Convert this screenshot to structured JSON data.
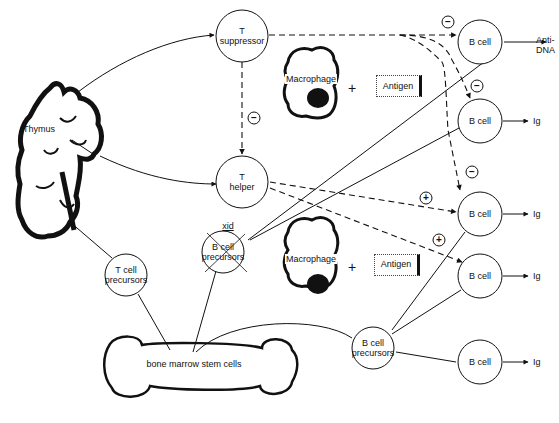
{
  "diagram": {
    "type": "immune-regulation-pathway",
    "organs": {
      "thymus": {
        "label": "Thymus"
      },
      "bone_marrow": {
        "label": "bone marrow stem cells"
      }
    },
    "nodes": {
      "t_suppressor": {
        "line1": "T",
        "line2": "suppressor"
      },
      "t_helper": {
        "line1": "T",
        "line2": "helper"
      },
      "t_cell_precursors": {
        "line1": "T cell",
        "line2": "precursors"
      },
      "xid_b_cell_precursors": {
        "tag": "xid",
        "line1": "B cell",
        "line2": "precursors",
        "crossed_out": true
      },
      "b_cell_precursors": {
        "line1": "B cell",
        "line2": "precursors"
      },
      "b_cell_1": {
        "label": "B cell",
        "output": "Anti-\nDNA",
        "output_line1": "Anti-",
        "output_line2": "DNA"
      },
      "b_cell_2": {
        "label": "B cell",
        "output": "Ig"
      },
      "b_cell_3": {
        "label": "B cell",
        "output": "Ig"
      },
      "b_cell_4": {
        "label": "B cell",
        "output": "Ig"
      },
      "b_cell_5": {
        "label": "B cell",
        "output": "Ig"
      }
    },
    "antigen_presentation": [
      {
        "macrophage": "Macrophage",
        "plus": "+",
        "antigen": "Antigen"
      },
      {
        "macrophage": "Macrophage",
        "plus": "+",
        "antigen": "Antigen"
      }
    ],
    "signs": {
      "minus": "−",
      "plus": "+"
    },
    "edges": [
      {
        "from": "thymus",
        "to": "t_suppressor",
        "style": "solid-arrow"
      },
      {
        "from": "thymus",
        "to": "t_helper",
        "style": "solid-arrow"
      },
      {
        "from": "thymus",
        "to": "t_cell_precursors",
        "style": "solid"
      },
      {
        "from": "t_suppressor",
        "to": "t_helper",
        "style": "dashed-arrow",
        "sign": "−"
      },
      {
        "from": "t_suppressor",
        "to": "b_cell_1",
        "style": "dashed-arrow",
        "sign": "−"
      },
      {
        "from": "t_suppressor",
        "to": "b_cell_2",
        "style": "dashed-arrow",
        "sign": "−"
      },
      {
        "from": "t_suppressor",
        "to": "b_cell_3",
        "style": "dashed-arrow",
        "sign": "−"
      },
      {
        "from": "t_helper",
        "to": "b_cell_3",
        "style": "dashed-arrow",
        "sign": "+"
      },
      {
        "from": "t_helper",
        "to": "b_cell_4",
        "style": "dashed-arrow",
        "sign": "+"
      },
      {
        "from": "xid_b_cell_precursors",
        "to": "b_cell_1",
        "style": "solid"
      },
      {
        "from": "xid_b_cell_precursors",
        "to": "b_cell_2",
        "style": "solid"
      },
      {
        "from": "bone_marrow",
        "to": "t_cell_precursors",
        "style": "solid"
      },
      {
        "from": "bone_marrow",
        "to": "xid_b_cell_precursors",
        "style": "solid"
      },
      {
        "from": "bone_marrow",
        "to": "b_cell_precursors",
        "style": "solid"
      },
      {
        "from": "b_cell_precursors",
        "to": "b_cell_3",
        "style": "solid"
      },
      {
        "from": "b_cell_precursors",
        "to": "b_cell_4",
        "style": "solid"
      },
      {
        "from": "b_cell_precursors",
        "to": "b_cell_5",
        "style": "solid"
      }
    ]
  }
}
